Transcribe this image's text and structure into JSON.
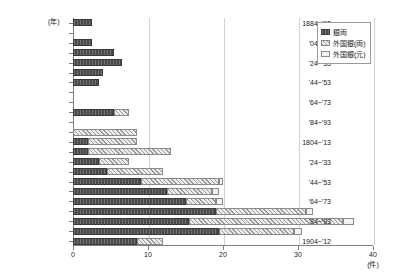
{
  "chart_data": {
    "type": "bar",
    "orientation": "horizontal",
    "stacked": true,
    "title": "",
    "xlabel": "(件)",
    "ylabel": "(年)",
    "xlim": [
      0,
      40
    ],
    "xticks": [
      0,
      10,
      20,
      30,
      40
    ],
    "grid": true,
    "legend_position": "top-right",
    "categories": [
      "1884~'93",
      "'94~'03",
      "'04~'13",
      "'14~'23",
      "'24~'33",
      "'34~'43",
      "'44~'53",
      "'54~'63",
      "'64~'73",
      "'74~'83",
      "'84~'93",
      "'94~'03",
      "1804~'13",
      "'14~'23",
      "'24~'33",
      "'34~'43",
      "'44~'53",
      "'54~'63",
      "'64~'73",
      "'74~'83",
      "'84~'93",
      "'94~'03",
      "1904~'12"
    ],
    "tick_labels_shown": [
      "1884~'93",
      "'04~'13",
      "'24~'33",
      "'44~'53",
      "'64~'73",
      "'84~'93",
      "1804~'13",
      "'24~'33",
      "'44~'53",
      "'64~'73",
      "'84~'93",
      "1904~'12"
    ],
    "series": [
      {
        "name": "銀両",
        "key": "a",
        "color": "#4a4a4a",
        "values": [
          2.5,
          0,
          2.5,
          5.5,
          6.5,
          4.0,
          3.5,
          0,
          0,
          5.5,
          0,
          0,
          2.0,
          2.0,
          3.5,
          4.5,
          9.0,
          12.5,
          15.0,
          19.0,
          15.5,
          19.5,
          8.5
        ]
      },
      {
        "name": "外国銀(両)",
        "key": "b",
        "color": "#e8e8e8",
        "values": [
          0,
          0,
          0,
          0,
          0,
          0,
          0,
          0,
          0,
          2.0,
          0,
          8.5,
          6.5,
          11.0,
          4.0,
          7.5,
          10.5,
          6.0,
          4.0,
          12.0,
          20.5,
          10.0,
          3.5
        ]
      },
      {
        "name": "外国銀(元)",
        "key": "c",
        "color": "#f2f2f2",
        "values": [
          0,
          0,
          0,
          0,
          0,
          0,
          0,
          0,
          0,
          0,
          0,
          0,
          0,
          0,
          0,
          0,
          0.5,
          1.0,
          1.0,
          1.0,
          1.5,
          1.0,
          0
        ]
      }
    ]
  },
  "legend": {
    "items": [
      {
        "label": "銀両",
        "swatch": "a"
      },
      {
        "label": "外国銀(両)",
        "swatch": "b"
      },
      {
        "label": "外国銀(元)",
        "swatch": "c"
      }
    ]
  }
}
